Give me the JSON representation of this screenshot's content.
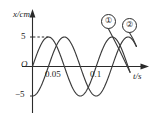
{
  "figure": {
    "kind": "physics-oscillation-graph",
    "background_color": "#ffffff",
    "line_color": "#3a3a3a",
    "axis_color": "#2b2b2b"
  },
  "axes": {
    "y_label": "x/cm",
    "x_label": "t/s",
    "origin_label": "O"
  },
  "ticks": {
    "y": [
      {
        "label": "5",
        "value": 5
      },
      {
        "label": "−5",
        "value": -5
      }
    ],
    "x": [
      {
        "label": "0.05",
        "value": 0.05
      },
      {
        "label": "0.1",
        "value": 0.1
      }
    ]
  },
  "curve_tags": [
    {
      "label": "①",
      "name": "curve-1"
    },
    {
      "label": "②",
      "name": "curve-2"
    }
  ],
  "chart_data": {
    "type": "line",
    "title": "",
    "xlabel": "t/s",
    "ylabel": "x/cm",
    "xlim": [
      0,
      0.135
    ],
    "ylim": [
      -6.4,
      6.4
    ],
    "grid": false,
    "legend_position": "inline-top-right",
    "xticks": [
      0.05,
      0.1
    ],
    "xticklabels": [
      "0.05",
      "0.1"
    ],
    "yticks": [
      5,
      -5
    ],
    "yticklabels": [
      "5",
      "−5"
    ],
    "annotations": [
      {
        "text": "dashed guide from y=5 to first crest of curve 1",
        "y": 5
      }
    ],
    "series": [
      {
        "name": "①",
        "amplitude": 5,
        "period": 0.08,
        "phase_deg": 0,
        "form": "x = 5 sin(2π t / 0.08)",
        "start_value": 0,
        "start_direction": "rising",
        "x": [
          0,
          0.005,
          0.01,
          0.015,
          0.02,
          0.025,
          0.03,
          0.035,
          0.04,
          0.045,
          0.05,
          0.055,
          0.06,
          0.065,
          0.07,
          0.075,
          0.08,
          0.085,
          0.09,
          0.095,
          0.1,
          0.105,
          0.11,
          0.115,
          0.12,
          0.125,
          0.13
        ],
        "values": [
          0,
          1.91,
          3.54,
          4.62,
          5,
          4.62,
          3.54,
          1.91,
          0,
          -1.91,
          -3.54,
          -4.62,
          -5,
          -4.62,
          -3.54,
          -1.91,
          0,
          1.91,
          3.54,
          4.62,
          5,
          4.62,
          3.54,
          1.91,
          0,
          -1.91,
          -3.54
        ]
      },
      {
        "name": "②",
        "amplitude": 5,
        "period": 0.08,
        "phase_deg": -90,
        "form": "x = −5 cos(2π t / 0.08)",
        "start_value": -5,
        "start_direction": "rising",
        "x": [
          0,
          0.005,
          0.01,
          0.015,
          0.02,
          0.025,
          0.03,
          0.035,
          0.04,
          0.045,
          0.05,
          0.055,
          0.06,
          0.065,
          0.07,
          0.075,
          0.08,
          0.085,
          0.09,
          0.095,
          0.1,
          0.105,
          0.11,
          0.115,
          0.12,
          0.125,
          0.13
        ],
        "values": [
          -5,
          -4.62,
          -3.54,
          -1.91,
          0,
          1.91,
          3.54,
          4.62,
          5,
          4.62,
          3.54,
          1.91,
          0,
          -1.91,
          -3.54,
          -4.62,
          -5,
          -4.62,
          -3.54,
          -1.91,
          0,
          1.91,
          3.54,
          4.62,
          5,
          4.62,
          3.54
        ]
      }
    ]
  }
}
